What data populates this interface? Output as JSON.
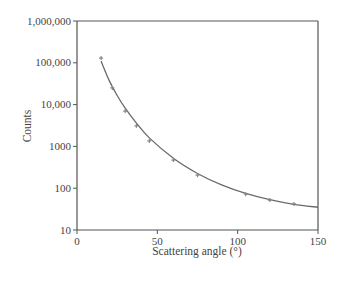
{
  "chart_data": {
    "type": "scatter",
    "title": "",
    "xlabel": "Scattering angle (°)",
    "ylabel": "Counts",
    "xlim": [
      0,
      150
    ],
    "ylim": [
      10,
      1000000
    ],
    "yscale": "log",
    "grid": false,
    "legend": null,
    "x_ticks": [
      0,
      50,
      100,
      150
    ],
    "x_tick_labels": [
      "0",
      "50",
      "100",
      "150"
    ],
    "y_ticks": [
      10,
      100,
      1000,
      10000,
      100000,
      1000000
    ],
    "y_tick_labels": [
      "10",
      "100",
      "1000",
      "10,000",
      "100,000",
      "1,000,000"
    ],
    "series": [
      {
        "name": "Measured counts",
        "kind": "points",
        "x": [
          15,
          22,
          30,
          37,
          45,
          60,
          75,
          105,
          120,
          135
        ],
        "y": [
          130000,
          25000,
          7000,
          3100,
          1350,
          470,
          205,
          72,
          52,
          42
        ]
      },
      {
        "name": "Theoretical curve",
        "kind": "line",
        "x": [
          15,
          20,
          25,
          30,
          37,
          45,
          60,
          75,
          90,
          105,
          120,
          135,
          150
        ],
        "y": [
          110000,
          38000,
          16500,
          8200,
          3600,
          1600,
          520,
          225,
          120,
          75,
          53,
          41,
          35
        ]
      }
    ]
  },
  "colors": {
    "axis": "#555555",
    "curve": "#6a6a6a",
    "points": "#888888",
    "text": "#444444"
  }
}
